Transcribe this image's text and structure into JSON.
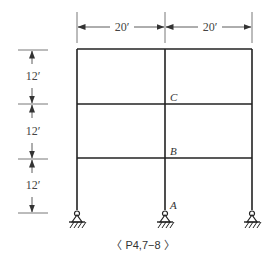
{
  "figure": {
    "caption": "〈 P4,7−8 〉",
    "type": "two-bay three-story rigid frame with pinned supports"
  },
  "dimensions": {
    "bay_widths": [
      {
        "label": "20′",
        "value_ft": 20
      },
      {
        "label": "20′",
        "value_ft": 20
      }
    ],
    "story_heights": [
      {
        "label": "12′",
        "value_ft": 12
      },
      {
        "label": "12′",
        "value_ft": 12
      },
      {
        "label": "12′",
        "value_ft": 12
      }
    ]
  },
  "nodes": {
    "A": "A",
    "B": "B",
    "C": "C"
  },
  "supports": [
    {
      "position": "left",
      "type": "pin"
    },
    {
      "position": "center",
      "type": "pin"
    },
    {
      "position": "right",
      "type": "pin"
    }
  ],
  "colors": {
    "line": "#222222",
    "dimension": "#555555"
  }
}
